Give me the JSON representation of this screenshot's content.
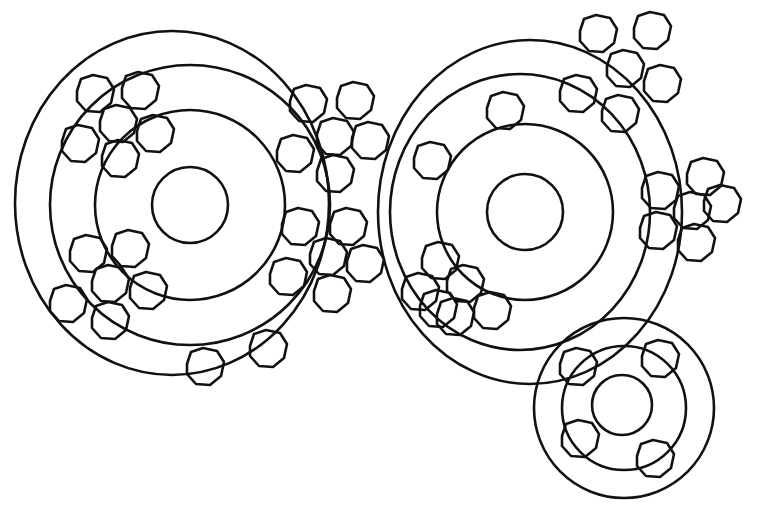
{
  "figure": {
    "type": "line-drawing",
    "stroke_color": "#111111",
    "background_color": "#ffffff"
  },
  "systems": [
    {
      "name": "left-system",
      "cx": 190,
      "cy": 205,
      "radii": [
        38,
        95,
        140,
        178
      ]
    },
    {
      "name": "right-system",
      "cx": 525,
      "cy": 212,
      "radii": [
        38,
        88,
        155,
        170
      ]
    },
    {
      "name": "small-system",
      "cx": 622,
      "cy": 405,
      "radii": [
        30,
        60,
        90
      ]
    }
  ],
  "cell_clusters": [
    {
      "name": "cluster-left-top",
      "cx": 115,
      "cy": 125,
      "count": 6
    },
    {
      "name": "cluster-left-bottom",
      "cx": 110,
      "cy": 285,
      "count": 6
    },
    {
      "name": "cluster-middle-top",
      "cx": 330,
      "cy": 140,
      "count": 7
    },
    {
      "name": "cluster-middle-bottom",
      "cx": 325,
      "cy": 255,
      "count": 7
    },
    {
      "name": "cluster-right-top",
      "cx": 620,
      "cy": 80,
      "count": 6
    },
    {
      "name": "cluster-right-mid",
      "cx": 690,
      "cy": 210,
      "count": 6
    },
    {
      "name": "cluster-right-lower",
      "cx": 455,
      "cy": 290,
      "count": 6
    },
    {
      "name": "cells-bottom-arc",
      "count": 2
    },
    {
      "name": "cells-right-inner",
      "count": 2
    },
    {
      "name": "cells-small-system",
      "count": 4
    }
  ]
}
